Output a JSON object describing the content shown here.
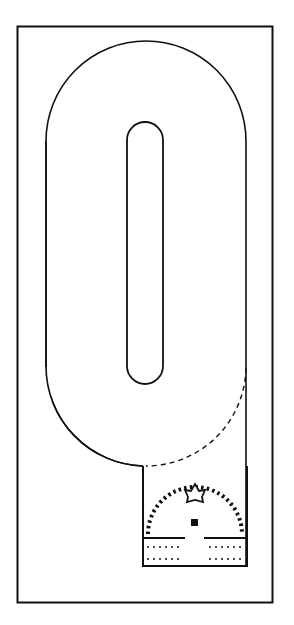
{
  "diagram": {
    "type": "track-layout",
    "colors": {
      "line": "#111111",
      "background": "#ffffff"
    },
    "frame": {
      "x": 17,
      "y": 26,
      "width": 256,
      "height": 577
    },
    "track": {
      "outer_left": 46,
      "outer_right": 246,
      "outer_top": 41,
      "outer_bottom": 466,
      "inner_left": 127,
      "inner_right": 163,
      "inner_top": 122,
      "inner_bottom": 384,
      "dashed_segment": "connector from right edge (y≈370) curving to start lane (x≈143, y≈466)"
    },
    "start_area": {
      "x": 143,
      "y": 466,
      "width": 104,
      "height": 100,
      "marker": "star-outline-icon",
      "center": "square-marker",
      "arc": "dashed-semicircle",
      "rows": 2
    }
  }
}
